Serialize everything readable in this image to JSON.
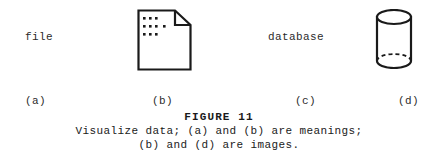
{
  "figure": {
    "items": [
      {
        "id": "a",
        "kind": "text",
        "label": "file",
        "sub_label": "(a)"
      },
      {
        "id": "b",
        "kind": "icon",
        "icon": "document-page-icon",
        "sub_label": "(b)"
      },
      {
        "id": "c",
        "kind": "text",
        "label": "database",
        "sub_label": "(c)"
      },
      {
        "id": "d",
        "kind": "icon",
        "icon": "database-cylinder-icon",
        "sub_label": "(d)"
      }
    ],
    "figure_number": "FIGURE 11",
    "caption_lines": [
      "Visualize data; (a) and (b) are meanings;",
      "(b) and (d) are images."
    ],
    "colors": {
      "background": "#ffffff",
      "ink": "#1a1a1a",
      "text": "#2b2b2b"
    }
  }
}
